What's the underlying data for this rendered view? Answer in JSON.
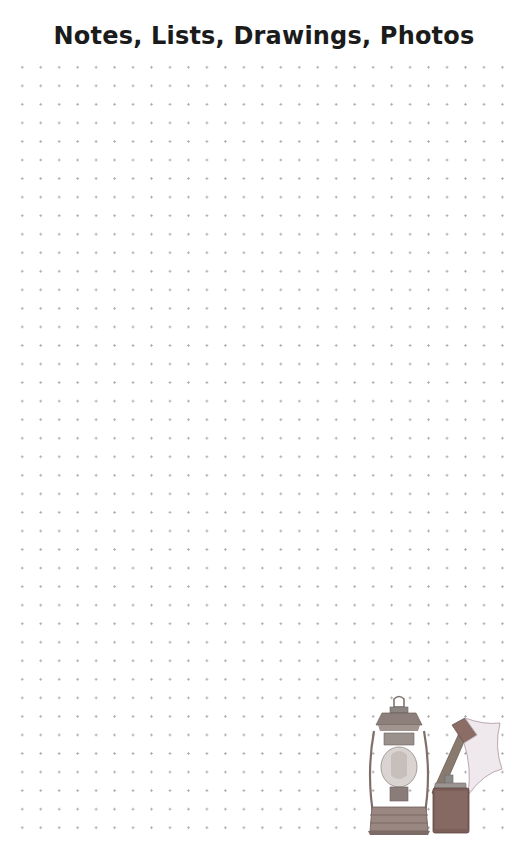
{
  "page": {
    "title": "Notes, Lists, Drawings, Photos",
    "background": "#ffffff",
    "grid": {
      "type": "dot-grid",
      "columns": 27,
      "rows": 42,
      "dot_color": "#a9a9a9"
    },
    "illustration": {
      "items": [
        "lantern-icon",
        "axe-icon",
        "flask-icon"
      ],
      "style": "watercolor-pencil"
    }
  }
}
